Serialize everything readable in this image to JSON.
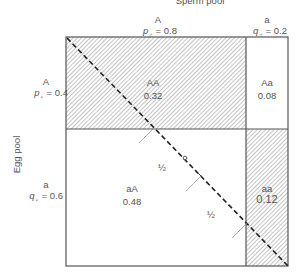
{
  "diagram": {
    "title": "Sperm pool",
    "y_axis_label": "Egg pool",
    "sperm": {
      "A": {
        "allele": "A",
        "freq_label": "p♂ = 0.8",
        "freq_symbol": "p",
        "sex": "♂",
        "value": "0.8"
      },
      "a": {
        "allele": "a",
        "freq_label": "q♂ = 0.2",
        "freq_symbol": "q",
        "sex": "♂",
        "value": "0.2"
      }
    },
    "egg": {
      "A": {
        "allele": "A",
        "freq_label": "p♀ = 0.4",
        "freq_symbol": "p",
        "sex": "♀",
        "value": "0.4"
      },
      "a": {
        "allele": "a",
        "freq_label": "q♀ = 0.6",
        "freq_symbol": "q",
        "sex": "♀",
        "value": "0.6"
      }
    },
    "cells": [
      {
        "genotype": "AA",
        "value": "0.32",
        "hatched": true
      },
      {
        "genotype": "Aa",
        "value": "0.08",
        "hatched": false
      },
      {
        "genotype": "aA",
        "value": "0.48",
        "hatched": false
      },
      {
        "genotype": "aa",
        "value": "0.12",
        "hatched": true
      }
    ],
    "half_labels": [
      "½",
      "½"
    ],
    "colors": {
      "line": "#555555",
      "hatch": "#888888",
      "text": "#555555"
    }
  }
}
